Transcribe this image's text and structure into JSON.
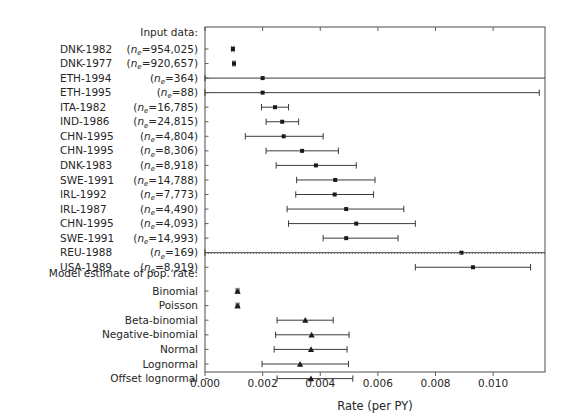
{
  "chart_data": {
    "type": "scatter",
    "subtype": "forest-plot",
    "title": "",
    "xlabel": "Rate (per PY)",
    "ylabel": "",
    "xlim": [
      0.0,
      0.0118
    ],
    "ylim_note": "categorical rows, top to bottom",
    "grid": false,
    "legend": null,
    "xticks": [
      0.0,
      0.002,
      0.004,
      0.006,
      0.008,
      0.01
    ],
    "xticklabels": [
      "0.000",
      "0.002",
      "0.004",
      "0.006",
      "0.008",
      "0.010"
    ],
    "sections": [
      {
        "header": "Input data:",
        "marker": "square",
        "rows": [
          {
            "label_left": "DNK-1982",
            "label_right": "(nₑ=954,025)",
            "n_e": 954025,
            "estimate": 0.000968,
            "low": 0.000932,
            "high": 0.001005,
            "clipped_left": false,
            "clipped_right": false
          },
          {
            "label_left": "DNK-1977",
            "label_right": "(nₑ=920,657)",
            "n_e": 920657,
            "estimate": 0.001005,
            "low": 0.000968,
            "high": 0.001043,
            "clipped_left": false,
            "clipped_right": false
          },
          {
            "label_left": "ETH-1994",
            "label_right": "(nₑ=364)",
            "n_e": 364,
            "estimate": 0.002,
            "low": 0.0,
            "high": 0.012,
            "clipped_left": true,
            "clipped_right": true
          },
          {
            "label_left": "ETH-1995",
            "label_right": "(nₑ=88)",
            "n_e": 88,
            "estimate": 0.002,
            "low": 0.0,
            "high": 0.0116,
            "clipped_left": true,
            "clipped_right": false
          },
          {
            "label_left": "ITA-1982",
            "label_right": "(nₑ=16,785)",
            "n_e": 16785,
            "estimate": 0.00243,
            "low": 0.00196,
            "high": 0.0029,
            "clipped_left": false,
            "clipped_right": false
          },
          {
            "label_left": "IND-1986",
            "label_right": "(nₑ=24,815)",
            "n_e": 24815,
            "estimate": 0.00268,
            "low": 0.00212,
            "high": 0.00325,
            "clipped_left": false,
            "clipped_right": false
          },
          {
            "label_left": "CHN-1995",
            "label_right": "(nₑ=4,804)",
            "n_e": 4804,
            "estimate": 0.00273,
            "low": 0.0014,
            "high": 0.0041,
            "clipped_left": false,
            "clipped_right": false
          },
          {
            "label_left": "CHN-1995",
            "label_right": "(nₑ=8,306)",
            "n_e": 8306,
            "estimate": 0.00337,
            "low": 0.00212,
            "high": 0.00463,
            "clipped_left": false,
            "clipped_right": false
          },
          {
            "label_left": "DNK-1983",
            "label_right": "(nₑ=8,918)",
            "n_e": 8918,
            "estimate": 0.00385,
            "low": 0.00247,
            "high": 0.00525,
            "clipped_left": false,
            "clipped_right": false
          },
          {
            "label_left": "SWE-1991",
            "label_right": "(nₑ=14,788)",
            "n_e": 14788,
            "estimate": 0.00452,
            "low": 0.00318,
            "high": 0.0059,
            "clipped_left": false,
            "clipped_right": false
          },
          {
            "label_left": "IRL-1992",
            "label_right": "(nₑ=7,773)",
            "n_e": 7773,
            "estimate": 0.0045,
            "low": 0.00315,
            "high": 0.00585,
            "clipped_left": false,
            "clipped_right": false
          },
          {
            "label_left": "IRL-1987",
            "label_right": "(nₑ=4,490)",
            "n_e": 4490,
            "estimate": 0.0049,
            "low": 0.00285,
            "high": 0.0069,
            "clipped_left": false,
            "clipped_right": false
          },
          {
            "label_left": "CHN-1995",
            "label_right": "(nₑ=4,093)",
            "n_e": 4093,
            "estimate": 0.00525,
            "low": 0.0029,
            "high": 0.0073,
            "clipped_left": false,
            "clipped_right": false
          },
          {
            "label_left": "SWE-1991",
            "label_right": "(nₑ=14,993)",
            "n_e": 14993,
            "estimate": 0.0049,
            "low": 0.0041,
            "high": 0.0067,
            "clipped_left": false,
            "clipped_right": false
          },
          {
            "label_left": "REU-1988",
            "label_right": "(nₑ=169)",
            "n_e": 169,
            "estimate": 0.0089,
            "low": 0.0,
            "high": 0.0119,
            "clipped_left": true,
            "clipped_right": true
          },
          {
            "label_left": "USA-1989",
            "label_right": "(nₑ=8,919)",
            "n_e": 8919,
            "estimate": 0.0093,
            "low": 0.0073,
            "high": 0.0113,
            "clipped_left": false,
            "clipped_right": false
          }
        ]
      },
      {
        "header": "Model estimate of pop. rate:",
        "marker": "triangle",
        "rows": [
          {
            "label_left": "",
            "label_right": "Binomial",
            "estimate": 0.00113,
            "low": 0.00108,
            "high": 0.00118,
            "clipped_left": false,
            "clipped_right": false
          },
          {
            "label_left": "",
            "label_right": "Poisson",
            "estimate": 0.00113,
            "low": 0.00108,
            "high": 0.00118,
            "clipped_left": false,
            "clipped_right": false
          },
          {
            "label_left": "",
            "label_right": "Beta-binomial",
            "estimate": 0.00348,
            "low": 0.0025,
            "high": 0.00445,
            "clipped_left": false,
            "clipped_right": false
          },
          {
            "label_left": "",
            "label_right": "Negative-binomial",
            "estimate": 0.0037,
            "low": 0.00245,
            "high": 0.005,
            "clipped_left": false,
            "clipped_right": false
          },
          {
            "label_left": "",
            "label_right": "Normal",
            "estimate": 0.00368,
            "low": 0.0024,
            "high": 0.00493,
            "clipped_left": false,
            "clipped_right": false
          },
          {
            "label_left": "",
            "label_right": "Lognormal",
            "estimate": 0.0033,
            "low": 0.00198,
            "high": 0.00498,
            "clipped_left": false,
            "clipped_right": false
          },
          {
            "label_left": "",
            "label_right": "Offset lognormal",
            "estimate": 0.00368,
            "low": 0.0025,
            "high": 0.00513,
            "clipped_left": false,
            "clipped_right": false
          }
        ]
      }
    ]
  },
  "style": {
    "line_color": "#3a3a3a",
    "marker_color": "#1a1a1a",
    "axis_color": "#4d4d4d",
    "separator_color": "#7a7a7a",
    "background": "#ffffff"
  }
}
